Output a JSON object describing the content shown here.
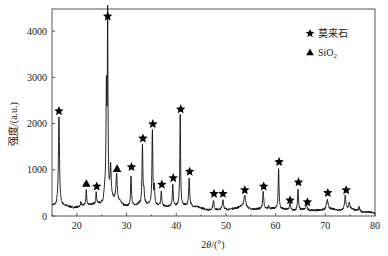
{
  "chart_data": {
    "type": "line",
    "title": "",
    "xlabel": "2θ/(°)",
    "ylabel": "强度/(a.u.)",
    "xlim": [
      15,
      80
    ],
    "ylim": [
      0,
      4480
    ],
    "xticks": [
      20,
      30,
      40,
      50,
      60,
      70,
      80
    ],
    "yticks": [
      0,
      1000,
      2000,
      3000,
      4000
    ],
    "grid": false,
    "legend": {
      "position": "upper right",
      "entries": [
        {
          "marker": "star",
          "label": "莫来石"
        },
        {
          "marker": "triangle",
          "label": "SiO₂"
        }
      ]
    },
    "baseline": [
      [
        15.2,
        230
      ],
      [
        15.8,
        210
      ],
      [
        16.0,
        250
      ],
      [
        17.5,
        220
      ],
      [
        18.5,
        200
      ],
      [
        19.5,
        180
      ],
      [
        20.5,
        200
      ],
      [
        21.5,
        230
      ],
      [
        23,
        250
      ],
      [
        24.8,
        260
      ],
      [
        25.3,
        300
      ],
      [
        25.6,
        500
      ],
      [
        27.4,
        350
      ],
      [
        28.8,
        300
      ],
      [
        29.5,
        220
      ],
      [
        30.2,
        210
      ],
      [
        31.8,
        230
      ],
      [
        32.5,
        260
      ],
      [
        34.2,
        250
      ],
      [
        36.2,
        230
      ],
      [
        38.2,
        200
      ],
      [
        40,
        220
      ],
      [
        41.8,
        220
      ],
      [
        43.6,
        200
      ],
      [
        45,
        170
      ],
      [
        46.5,
        130
      ],
      [
        48.5,
        130
      ],
      [
        50.5,
        140
      ],
      [
        52.5,
        180
      ],
      [
        53.3,
        220
      ],
      [
        55,
        140
      ],
      [
        56.5,
        150
      ],
      [
        58.5,
        150
      ],
      [
        59.5,
        160
      ],
      [
        61.5,
        150
      ],
      [
        63.5,
        120
      ],
      [
        65.5,
        140
      ],
      [
        67.5,
        120
      ],
      [
        69.5,
        130
      ],
      [
        71.5,
        150
      ],
      [
        73,
        120
      ],
      [
        75.5,
        150
      ],
      [
        77,
        90
      ],
      [
        79,
        80
      ],
      [
        80,
        60
      ]
    ],
    "peaks": [
      {
        "x": 16.4,
        "y": 2150,
        "w": 0.25,
        "phase": "mullite"
      },
      {
        "x": 20.8,
        "y": 300,
        "w": 0.2,
        "phase": ""
      },
      {
        "x": 21.9,
        "y": 560,
        "w": 0.18,
        "phase": "SiO2"
      },
      {
        "x": 23.9,
        "y": 500,
        "w": 0.2,
        "phase": "mullite"
      },
      {
        "x": 24.4,
        "y": 280,
        "w": 0.2,
        "phase": ""
      },
      {
        "x": 25.95,
        "y": 2700,
        "w": 0.2,
        "phase": ""
      },
      {
        "x": 26.2,
        "y": 4200,
        "w": 0.15,
        "phase": "mullite"
      },
      {
        "x": 26.8,
        "y": 1050,
        "w": 0.25,
        "phase": ""
      },
      {
        "x": 28.0,
        "y": 900,
        "w": 0.3,
        "phase": "SiO2"
      },
      {
        "x": 30.9,
        "y": 900,
        "w": 0.2,
        "phase": "mullite"
      },
      {
        "x": 33.2,
        "y": 1530,
        "w": 0.2,
        "phase": "mullite"
      },
      {
        "x": 33.5,
        "y": 500,
        "w": 0.2,
        "phase": ""
      },
      {
        "x": 35.2,
        "y": 1850,
        "w": 0.2,
        "phase": "mullite"
      },
      {
        "x": 35.6,
        "y": 600,
        "w": 0.2,
        "phase": ""
      },
      {
        "x": 37.0,
        "y": 540,
        "w": 0.2,
        "phase": "mullite"
      },
      {
        "x": 39.3,
        "y": 700,
        "w": 0.2,
        "phase": "mullite"
      },
      {
        "x": 40.8,
        "y": 2170,
        "w": 0.18,
        "phase": "mullite"
      },
      {
        "x": 42.6,
        "y": 800,
        "w": 0.25,
        "phase": "mullite"
      },
      {
        "x": 44.2,
        "y": 200,
        "w": 0.3,
        "phase": ""
      },
      {
        "x": 47.5,
        "y": 330,
        "w": 0.3,
        "phase": "mullite"
      },
      {
        "x": 49.4,
        "y": 350,
        "w": 0.3,
        "phase": "mullite"
      },
      {
        "x": 53.8,
        "y": 440,
        "w": 0.4,
        "phase": "mullite"
      },
      {
        "x": 57.5,
        "y": 530,
        "w": 0.25,
        "phase": "mullite"
      },
      {
        "x": 58.6,
        "y": 220,
        "w": 0.25,
        "phase": ""
      },
      {
        "x": 60.6,
        "y": 1020,
        "w": 0.2,
        "phase": "mullite"
      },
      {
        "x": 62.9,
        "y": 270,
        "w": 0.25,
        "phase": "mullite"
      },
      {
        "x": 64.5,
        "y": 600,
        "w": 0.2,
        "phase": "mullite"
      },
      {
        "x": 66.2,
        "y": 270,
        "w": 0.25,
        "phase": "mullite"
      },
      {
        "x": 70.4,
        "y": 370,
        "w": 0.35,
        "phase": "mullite"
      },
      {
        "x": 74.0,
        "y": 430,
        "w": 0.3,
        "phase": "mullite"
      },
      {
        "x": 74.8,
        "y": 300,
        "w": 0.3,
        "phase": ""
      },
      {
        "x": 76.8,
        "y": 190,
        "w": 0.3,
        "phase": ""
      }
    ],
    "markers": [
      {
        "x": 16.4,
        "y": 2270,
        "type": "star"
      },
      {
        "x": 21.9,
        "y": 700,
        "type": "triangle"
      },
      {
        "x": 24.0,
        "y": 640,
        "type": "star"
      },
      {
        "x": 26.2,
        "y": 4320,
        "type": "star"
      },
      {
        "x": 28.1,
        "y": 1020,
        "type": "triangle"
      },
      {
        "x": 31.0,
        "y": 1060,
        "type": "star"
      },
      {
        "x": 33.3,
        "y": 1680,
        "type": "star"
      },
      {
        "x": 35.3,
        "y": 1990,
        "type": "star"
      },
      {
        "x": 37.1,
        "y": 680,
        "type": "star"
      },
      {
        "x": 39.4,
        "y": 820,
        "type": "star"
      },
      {
        "x": 40.9,
        "y": 2310,
        "type": "star"
      },
      {
        "x": 42.7,
        "y": 960,
        "type": "star"
      },
      {
        "x": 47.6,
        "y": 480,
        "type": "star"
      },
      {
        "x": 49.4,
        "y": 480,
        "type": "star"
      },
      {
        "x": 53.8,
        "y": 560,
        "type": "star"
      },
      {
        "x": 57.6,
        "y": 640,
        "type": "star"
      },
      {
        "x": 60.7,
        "y": 1170,
        "type": "star"
      },
      {
        "x": 62.9,
        "y": 340,
        "type": "star"
      },
      {
        "x": 64.6,
        "y": 730,
        "type": "star"
      },
      {
        "x": 66.4,
        "y": 300,
        "type": "star"
      },
      {
        "x": 70.5,
        "y": 500,
        "type": "star"
      },
      {
        "x": 74.2,
        "y": 560,
        "type": "star"
      }
    ]
  },
  "legend": {
    "mullite_label": "莫来石",
    "sio2_label_main": "SiO",
    "sio2_label_sub": "2"
  },
  "axes": {
    "xlabel_pre": "2",
    "xlabel_theta": "θ",
    "xlabel_post": "/(°)",
    "ylabel": "强度/(a.u.)"
  }
}
